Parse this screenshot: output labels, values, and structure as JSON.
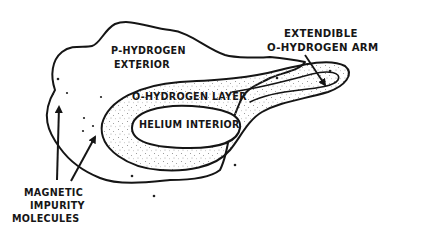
{
  "diagram": {
    "title": "",
    "regions": {
      "exterior": {
        "line1": "P-HYDROGEN",
        "line2": "EXTERIOR"
      },
      "layer": {
        "label": "O-HYDROGEN LAYER"
      },
      "interior": {
        "label": "HELIUM INTERIOR"
      }
    },
    "callouts": {
      "arm": {
        "line1": "EXTENDIBLE",
        "line2": "O-HYDROGEN ARM"
      },
      "impurities": {
        "line1": "MAGNETIC",
        "line2": "IMPURITY",
        "line3": "MOLECULES"
      }
    },
    "colors": {
      "ink": "#151515",
      "background": "#ffffff"
    }
  }
}
